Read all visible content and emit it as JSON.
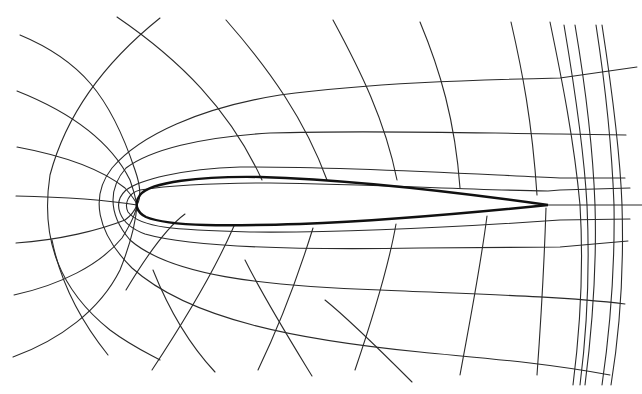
{
  "diagram": {
    "title": "",
    "colors": {
      "background": "#ffffff",
      "grid": "#2a2a2a",
      "airfoil": "#111111"
    },
    "airfoil": {
      "leading_edge": [
        137,
        205
      ],
      "trailing_edge": [
        548,
        205
      ],
      "path": "M548,205 C470,194 360,180 260,177 C200,176 150,182 140,195 C134,203 136,212 146,217 C170,227 230,226 300,224 C400,220 480,212 548,205"
    },
    "wrap_lines": [
      "M642,205 L548,205",
      "M630,188 L560,190 L548,191 C470,190 370,184 270,183 C200,183 160,187 140,190 C128,193 124,204 128,212 C140,228 175,230 250,232 C350,233 460,227 560,220 L630,219",
      "M625,178 L560,178 C470,174 340,166 240,167 C180,169 140,180 126,190 C112,203 118,224 145,234 C190,247 300,250 420,248 L560,247 L628,241",
      "M626,135 L560,134 C470,133 370,130 270,133 C200,137 150,150 126,168 C110,186 106,212 130,240 C170,275 260,286 380,290 C470,294 560,296 625,304",
      "M637,67 L560,78 C470,80 370,83 280,95 C200,108 140,135 112,168 C90,196 96,232 132,268 C190,320 300,340 420,352 C480,358 540,362 610,375",
      "M20,35 C80,60 110,95 135,170 C142,190 140,200 137,205",
      "M17,91 C70,112 110,140 130,180 C135,194 136,200 137,205",
      "M17,147 C60,155 100,168 125,188 C133,197 136,201 137,205",
      "M16,196 C60,197 100,199 137,205",
      "M16,243 C60,240 100,230 125,220 C132,215 135,210 137,205",
      "M14,295 C60,285 100,265 122,238 C132,222 136,212 137,205",
      "M13,357 C60,340 100,310 120,270 C132,240 136,220 137,205"
    ],
    "radial_lines": [
      "M160,18 C120,50 70,100 50,175 C40,240 60,290 110,330 C130,345 145,352 160,360",
      "M117,17 C180,60 230,110 262,180",
      "M226,20 C270,70 305,120 327,180",
      "M333,20 C360,70 385,120 397,180",
      "M420,22 C440,70 455,120 460,188",
      "M511,22 C522,70 532,120 537,195",
      "M550,22 C562,80 574,140 580,205 C584,270 580,330 573,385",
      "M564,25 C575,90 584,150 587,205 C590,270 587,330 580,385",
      "M575,25 C586,90 593,150 595,205 C597,270 592,330 585,385",
      "M596,25 C606,90 612,150 614,205 C615,270 610,330 602,385",
      "M602,25 C612,90 620,150 622,205 C624,270 620,330 611,385",
      "M126,290 C150,250 170,225 185,214",
      "M152,370 C185,320 215,270 234,226",
      "M258,370 C282,320 300,270 313,228",
      "M355,370 C372,320 388,270 396,224",
      "M460,375 C470,320 480,270 487,216",
      "M537,375 C541,320 544,270 546,208",
      "M108,355 C80,320 60,280 52,240",
      "M215,372 C185,340 165,300 153,270",
      "M312,376 C290,340 265,300 245,260",
      "M412,382 C380,350 350,320 325,300"
    ]
  }
}
